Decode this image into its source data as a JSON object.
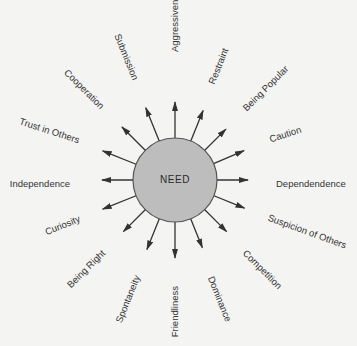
{
  "diagram": {
    "center": {
      "label": "NEED",
      "x": 175,
      "y": 180,
      "r": 42,
      "fill": "#bdbdbd",
      "stroke": "#555555"
    },
    "arrow_color": "#333333",
    "spokes": [
      {
        "label": "Aggressiveness",
        "angle": -90,
        "len": 78,
        "lx": 175,
        "ly": 52,
        "rot": -90,
        "anchor": "start"
      },
      {
        "label": "Restraint",
        "angle": -68,
        "len": 75,
        "lx": 212,
        "ly": 84,
        "rot": -68,
        "anchor": "start"
      },
      {
        "label": "Being Popular",
        "angle": -45,
        "len": 72,
        "lx": 245,
        "ly": 110,
        "rot": -45,
        "anchor": "start"
      },
      {
        "label": "Caution",
        "angle": -23,
        "len": 75,
        "lx": 270,
        "ly": 140,
        "rot": -18,
        "anchor": "start"
      },
      {
        "label": "Dependendence",
        "angle": 0,
        "len": 73,
        "lx": 276,
        "ly": 184,
        "rot": 0,
        "anchor": "start"
      },
      {
        "label": "Suspicion of Others",
        "angle": 22,
        "len": 75,
        "lx": 268,
        "ly": 218,
        "rot": 20,
        "anchor": "start"
      },
      {
        "label": "Competition",
        "angle": 45,
        "len": 73,
        "lx": 244,
        "ly": 252,
        "rot": 45,
        "anchor": "start"
      },
      {
        "label": "Dominance",
        "angle": 68,
        "len": 73,
        "lx": 210,
        "ly": 277,
        "rot": 68,
        "anchor": "start"
      },
      {
        "label": "Friendliness",
        "angle": 90,
        "len": 78,
        "lx": 175,
        "ly": 286,
        "rot": -90,
        "anchor": "end"
      },
      {
        "label": "Spontaneity",
        "angle": 112,
        "len": 75,
        "lx": 138,
        "ly": 276,
        "rot": -68,
        "anchor": "end"
      },
      {
        "label": "Being Right",
        "angle": 135,
        "len": 73,
        "lx": 104,
        "ly": 252,
        "rot": -45,
        "anchor": "end"
      },
      {
        "label": "Curiosity",
        "angle": 158,
        "len": 78,
        "lx": 80,
        "ly": 219,
        "rot": -22,
        "anchor": "end"
      },
      {
        "label": "Independence",
        "angle": 180,
        "len": 73,
        "lx": 70,
        "ly": 184,
        "rot": 0,
        "anchor": "end"
      },
      {
        "label": "Trust in Others",
        "angle": 202,
        "len": 78,
        "lx": 79,
        "ly": 141,
        "rot": 18,
        "anchor": "end"
      },
      {
        "label": "Cooperation",
        "angle": 225,
        "len": 75,
        "lx": 102,
        "ly": 108,
        "rot": 45,
        "anchor": "end"
      },
      {
        "label": "Submission",
        "angle": 248,
        "len": 78,
        "lx": 135,
        "ly": 80,
        "rot": 68,
        "anchor": "end"
      }
    ]
  }
}
